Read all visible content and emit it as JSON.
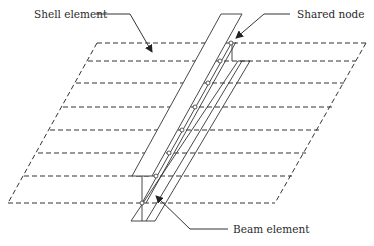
{
  "diagram": {
    "labels": {
      "shell": "Shell element",
      "shared_node": "Shared node",
      "beam": "Beam element"
    },
    "colors": {
      "line": "#333333",
      "background": "#ffffff",
      "text": "#2a2a2a"
    },
    "shell_grid_rows": 8,
    "shared_node_count": 8
  }
}
